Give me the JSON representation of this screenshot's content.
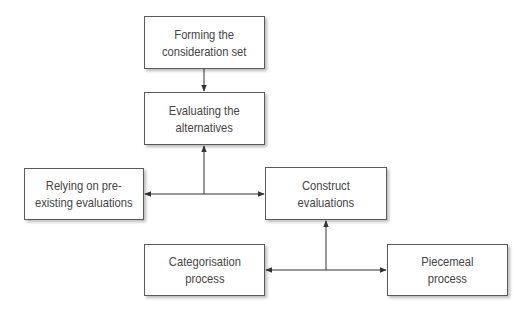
{
  "diagram": {
    "nodes": [
      {
        "id": "forming",
        "label": "Forming the\nconsideration set"
      },
      {
        "id": "evaluating",
        "label": "Evaluating the\nalternatives"
      },
      {
        "id": "relying",
        "label": "Relying on pre-\nexisting evaluations"
      },
      {
        "id": "construct",
        "label": "Construct\nevaluations"
      },
      {
        "id": "categorisation",
        "label": "Categorisation\nprocess"
      },
      {
        "id": "piecemeal",
        "label": "Piecemeal\nprocess"
      }
    ],
    "edges": [
      {
        "from": "forming",
        "to": "evaluating"
      },
      {
        "from": "junction-1",
        "to": "evaluating"
      },
      {
        "from": "junction-1",
        "to": "relying"
      },
      {
        "from": "junction-1",
        "to": "construct"
      },
      {
        "from": "junction-2",
        "to": "construct"
      },
      {
        "from": "junction-2",
        "to": "categorisation"
      },
      {
        "from": "junction-2",
        "to": "piecemeal"
      }
    ],
    "colors": {
      "line": "#333333",
      "border": "#5a5a5a",
      "text": "#454545",
      "background": "#ffffff"
    }
  }
}
